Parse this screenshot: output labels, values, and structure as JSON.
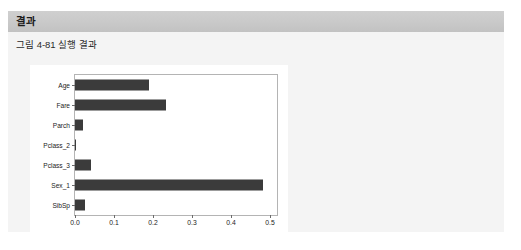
{
  "header": {
    "title": "결과"
  },
  "caption": {
    "text": "그림 4-81 실행 결과"
  },
  "colors": {
    "panel_background": "#f4f4f4",
    "header_band": "#c9c9c9",
    "page_background": "#ffffff",
    "bar_fill": "#3b3b3b",
    "axes_frame": "#b4b4b4",
    "tick_text": "#232323"
  },
  "chart_data": {
    "type": "bar",
    "orientation": "horizontal",
    "title": "",
    "xlabel": "",
    "ylabel": "",
    "categories": [
      "Age",
      "Fare",
      "Parch",
      "Pclass_2",
      "Pclass_3",
      "Sex_1",
      "SibSp"
    ],
    "values": [
      0.19,
      0.233,
      0.021,
      0.003,
      0.042,
      0.482,
      0.026
    ],
    "xlim": [
      0.0,
      0.518
    ],
    "xticks": [
      0.0,
      0.1,
      0.2,
      0.3,
      0.4,
      0.5
    ],
    "xticklabels": [
      "0.0",
      "0.1",
      "0.2",
      "0.3",
      "0.4",
      "0.5"
    ],
    "grid": false,
    "legend": null
  }
}
